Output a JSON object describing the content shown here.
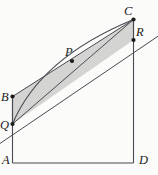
{
  "figure": {
    "background_color": "#fbfbfa",
    "line_color": "#3a3a44",
    "shade_fill": "#d4d4d2",
    "shade_stroke": "#5a5a60",
    "point_color": "#1a1a1a",
    "labels": {
      "A": "A",
      "B": "B",
      "C": "C",
      "D": "D",
      "P": "P",
      "Q": "Q",
      "R": "R"
    },
    "label_positions": {
      "A": {
        "x": 3,
        "y": 161
      },
      "B": {
        "x": 2,
        "y": 101
      },
      "C": {
        "x": 125,
        "y": 13
      },
      "D": {
        "x": 140,
        "y": 161
      },
      "P": {
        "x": 66,
        "y": 54
      },
      "Q": {
        "x": 1,
        "y": 127
      },
      "R": {
        "x": 137,
        "y": 33
      }
    },
    "points": {
      "A": {
        "x": 12.5,
        "y": 163
      },
      "B": {
        "x": 12.5,
        "y": 96.5
      },
      "C": {
        "x": 133.5,
        "y": 19.5
      },
      "D": {
        "x": 133.5,
        "y": 163
      },
      "P": {
        "x": 72,
        "y": 61
      },
      "Q": {
        "x": 12.5,
        "y": 124
      },
      "R": {
        "x": 133.5,
        "y": 40
      }
    },
    "shaded_polygon": [
      "B",
      "C",
      "R",
      "Q"
    ],
    "segments": [
      {
        "name": "side-AB",
        "from": "A",
        "to": "B"
      },
      {
        "name": "side-AD",
        "from": "A",
        "to": "D"
      },
      {
        "name": "side-DC",
        "from": "D",
        "to": "C"
      },
      {
        "name": "side-BC",
        "from": "B",
        "to": "C"
      },
      {
        "name": "side-QR",
        "from": "Q",
        "to": "R"
      },
      {
        "name": "side-BQ",
        "from": "B",
        "to": "Q"
      },
      {
        "name": "side-CR",
        "from": "C",
        "to": "R"
      },
      {
        "name": "diagonal-QC",
        "from": "Q",
        "to": "C"
      }
    ],
    "curve": {
      "name": "arc-through-P",
      "from": "Q",
      "through": "P",
      "to": "C",
      "control": {
        "x": 40,
        "y": 58
      }
    },
    "extension_line": {
      "name": "line-through-QR-extended",
      "x1": -2,
      "y1": 145,
      "x2": 158,
      "y2": 36
    }
  }
}
